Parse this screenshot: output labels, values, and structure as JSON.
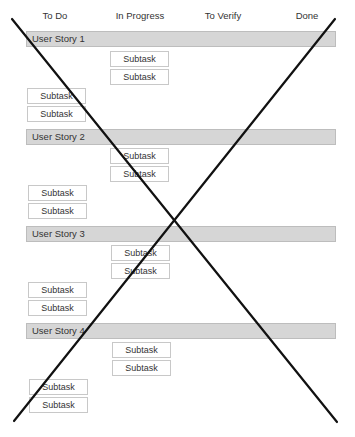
{
  "board": {
    "columns": [
      "To Do",
      "In Progress",
      "To Verify",
      "Done"
    ],
    "stories": [
      {
        "label": "User Story 1",
        "in_progress": [
          "Subtask",
          "Subtask"
        ],
        "to_do": [
          "Subtask",
          "Subtask"
        ]
      },
      {
        "label": "User Story 2",
        "in_progress": [
          "Subtask",
          "Subtask"
        ],
        "to_do": [
          "Subtask",
          "Subtask"
        ]
      },
      {
        "label": "User Story 3",
        "in_progress": [
          "Subtask",
          "Subtask"
        ],
        "to_do": [
          "Subtask",
          "Subtask"
        ]
      },
      {
        "label": "User Story 4",
        "in_progress": [
          "Subtask",
          "Subtask"
        ],
        "to_do": [
          "Subtask",
          "Subtask"
        ]
      }
    ]
  },
  "overlay": {
    "type": "cross-out",
    "color": "#111111"
  }
}
